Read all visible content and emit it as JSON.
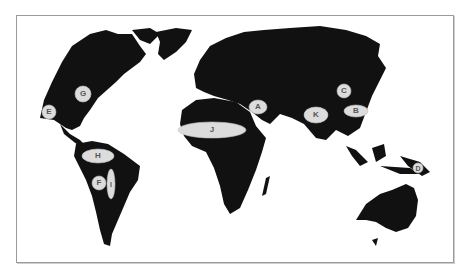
{
  "map": {
    "type": "world-map",
    "style": "black landmasses on white, framed",
    "colors": {
      "land": "#111111",
      "ocean": "#ffffff",
      "marker_fill": "#dcdcdc",
      "label_text": "#555555",
      "frame": "#9a9a9a"
    },
    "markers": [
      {
        "id": "A",
        "label": "A",
        "region": "Middle East"
      },
      {
        "id": "B",
        "label": "B",
        "region": "Southern China"
      },
      {
        "id": "C",
        "label": "C",
        "region": "Northern China"
      },
      {
        "id": "D",
        "label": "D",
        "region": "New Guinea"
      },
      {
        "id": "E",
        "label": "E",
        "region": "Mexico"
      },
      {
        "id": "F",
        "label": "F",
        "region": "Andes"
      },
      {
        "id": "G",
        "label": "G",
        "region": "Eastern North America"
      },
      {
        "id": "H",
        "label": "H",
        "region": "Northern South America"
      },
      {
        "id": "I",
        "label": "I",
        "region": "Amazonia"
      },
      {
        "id": "J",
        "label": "J",
        "region": "Sahel"
      },
      {
        "id": "K",
        "label": "K",
        "region": "India"
      }
    ]
  }
}
